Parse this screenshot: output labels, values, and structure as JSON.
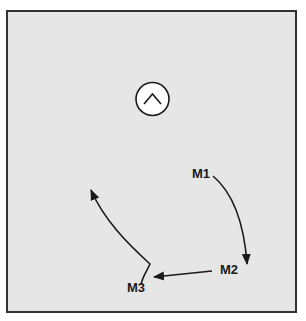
{
  "diagram": {
    "background_color": "#e6e6e6",
    "border_color": "#333333",
    "symbol": {
      "icon": "chevron-up-in-circle-icon"
    },
    "markers": [
      {
        "id": "m1",
        "label": "M1"
      },
      {
        "id": "m2",
        "label": "M2"
      },
      {
        "id": "m3",
        "label": "M3"
      }
    ]
  }
}
